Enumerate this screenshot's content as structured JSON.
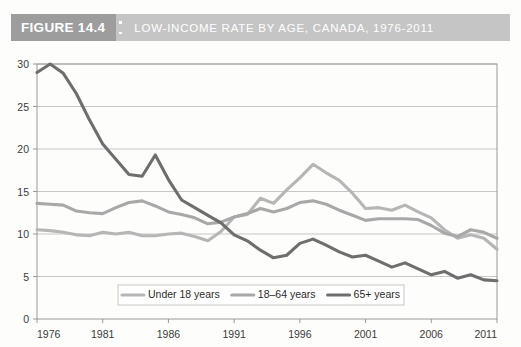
{
  "banner": {
    "figure_label": "FIGURE 14.4",
    "title": "LOW-INCOME RATE BY AGE, CANADA, 1976-2011",
    "label_bg": "#9d9d9d",
    "title_bg": "#c5c5c5",
    "text_color": "#ffffff"
  },
  "chart_data": {
    "type": "line",
    "title": "LOW-INCOME RATE BY AGE, CANADA, 1976-2011",
    "xlabel": "",
    "ylabel": "",
    "xlim": [
      1976,
      2011
    ],
    "ylim": [
      0,
      30
    ],
    "ytick_values": [
      0,
      5,
      10,
      15,
      20,
      25,
      30
    ],
    "ytick_labels": [
      "0",
      "5",
      "10",
      "15",
      "20",
      "25",
      "30"
    ],
    "xtick_values": [
      1976,
      1981,
      1986,
      1991,
      1996,
      2001,
      2006,
      2011
    ],
    "xtick_labels": [
      "1976",
      "1981",
      "1986",
      "1991",
      "1996",
      "2001",
      "2006",
      "2011"
    ],
    "grid": "horizontal",
    "legend_position": "bottom-center",
    "x": [
      1976,
      1977,
      1978,
      1979,
      1980,
      1981,
      1982,
      1983,
      1984,
      1985,
      1986,
      1987,
      1988,
      1989,
      1990,
      1991,
      1992,
      1993,
      1994,
      1995,
      1996,
      1997,
      1998,
      1999,
      2000,
      2001,
      2002,
      2003,
      2004,
      2005,
      2006,
      2007,
      2008,
      2009,
      2010,
      2011
    ],
    "series": [
      {
        "name": "Under 18 years",
        "color": "#b6b6b6",
        "values": [
          10.5,
          10.4,
          10.2,
          9.9,
          9.8,
          10.2,
          10.0,
          10.2,
          9.8,
          9.8,
          10.0,
          10.1,
          9.7,
          9.2,
          10.3,
          12.0,
          12.3,
          14.2,
          13.6,
          15.2,
          16.6,
          18.2,
          17.2,
          16.3,
          14.8,
          13.0,
          13.1,
          12.8,
          13.4,
          12.6,
          11.9,
          10.5,
          9.5,
          9.9,
          9.5,
          8.2
        ]
      },
      {
        "name": "18-64 years",
        "color": "#a8a8a8",
        "values": [
          13.6,
          13.5,
          13.4,
          12.7,
          12.5,
          12.4,
          13.1,
          13.7,
          13.9,
          13.3,
          12.6,
          12.3,
          11.9,
          11.2,
          11.4,
          12.0,
          12.4,
          13.0,
          12.6,
          13.0,
          13.7,
          13.9,
          13.5,
          12.8,
          12.2,
          11.6,
          11.8,
          11.8,
          11.8,
          11.7,
          11.0,
          10.1,
          9.7,
          10.5,
          10.2,
          9.5
        ]
      },
      {
        "name": "65+ years",
        "color": "#6e6e6e",
        "values": [
          29.0,
          30.0,
          28.9,
          26.5,
          23.4,
          20.6,
          18.8,
          17.0,
          16.8,
          19.3,
          16.4,
          14.0,
          13.1,
          12.2,
          11.3,
          9.9,
          9.2,
          8.1,
          7.2,
          7.5,
          8.9,
          9.4,
          8.7,
          7.9,
          7.3,
          7.5,
          6.8,
          6.1,
          6.6,
          5.9,
          5.2,
          5.6,
          4.8,
          5.2,
          4.6,
          4.5
        ]
      }
    ],
    "legend": [
      {
        "label": "Under 18 years",
        "color": "#b6b6b6"
      },
      {
        "label": "18–64 years",
        "color": "#a8a8a8"
      },
      {
        "label": "65+ years",
        "color": "#6e6e6e"
      }
    ]
  }
}
